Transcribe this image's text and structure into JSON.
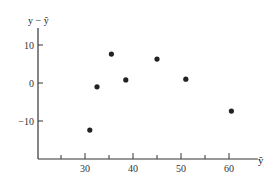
{
  "chart_data": {
    "type": "scatter",
    "title": "",
    "xlabel": "ŷ",
    "ylabel": "y − ŷ",
    "x_ticks": [
      25,
      30,
      35,
      40,
      45,
      50,
      55,
      60
    ],
    "x_tick_labels": [
      "30",
      "40",
      "50",
      "60"
    ],
    "y_ticks": [
      10,
      0,
      -10
    ],
    "y_tick_labels": [
      "10",
      "0",
      "-10"
    ],
    "xlim": [
      20.5,
      66
    ],
    "ylim": [
      -20,
      16
    ],
    "grid": false,
    "legend": null,
    "x": [
      31,
      32.5,
      35.5,
      38.5,
      45,
      51,
      60.5
    ],
    "y": [
      -12.4,
      -1,
      7.6,
      0.8,
      6.3,
      1,
      -7.4
    ],
    "marker_color": "#222222"
  }
}
